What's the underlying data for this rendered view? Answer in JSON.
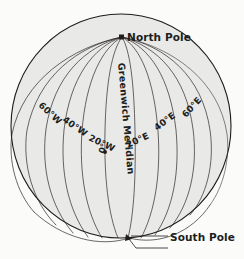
{
  "figure": {
    "type": "globe-graticule-diagram",
    "background_color": "#fbfbfa",
    "globe_fill_color": "#e9e9e7",
    "line_color": "#2b2826",
    "text_color": "#201d1c"
  },
  "globe": {
    "center_x": 121,
    "center_y": 126,
    "radius_x": 110,
    "radius_y": 112
  },
  "poles": {
    "north": {
      "label": "North Pole",
      "marker": "square-marker",
      "x": 122,
      "y": 37
    },
    "south": {
      "label": "South Pole",
      "marker": "arrow-marker",
      "x": 129,
      "y": 238
    }
  },
  "prime_meridian": {
    "label": "Greenwich Meridian",
    "value_label": "0°"
  },
  "meridians": [
    {
      "label": "60°W",
      "longitude": -60,
      "hemisphere": "west"
    },
    {
      "label": "40°W",
      "longitude": -40,
      "hemisphere": "west"
    },
    {
      "label": "20°W",
      "longitude": -20,
      "hemisphere": "west"
    },
    {
      "label": "0°",
      "longitude": 0,
      "hemisphere": "prime"
    },
    {
      "label": "20°E",
      "longitude": 20,
      "hemisphere": "east"
    },
    {
      "label": "40°E",
      "longitude": 40,
      "hemisphere": "east"
    },
    {
      "label": "60°E",
      "longitude": 60,
      "hemisphere": "east"
    }
  ]
}
